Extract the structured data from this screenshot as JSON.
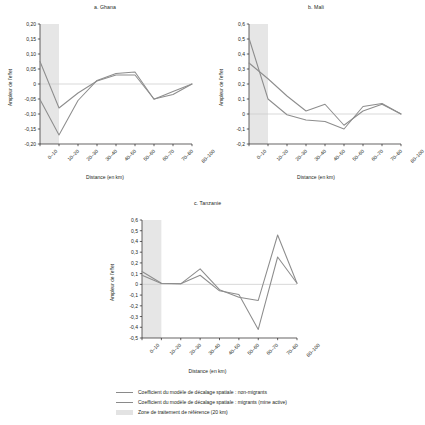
{
  "figure": {
    "background": "#ffffff",
    "line_color_nonmigrants": "#8d8d8d",
    "line_color_migrants": "#8d8d8d",
    "shade_color": "#e6e6e6",
    "zero_line_color": "#c9c9c9",
    "axis_color": "#231f20"
  },
  "legend": {
    "items": [
      {
        "marker": "line",
        "label": "Coefficient du modèle de décalage spatiale : non-migrants"
      },
      {
        "marker": "line",
        "label": "Coefficient du modèle de décalage spatiale : migrants (mine active)"
      },
      {
        "marker": "shade",
        "label": "Zone de traitement de référence (20 km)"
      }
    ]
  },
  "chart_data": [
    {
      "type": "line",
      "title": "a. Ghana",
      "xlabel": "Distance (en km)",
      "ylabel": "Ampleur de l'effet",
      "categories": [
        "0–10",
        "10–20",
        "20–30",
        "30–40",
        "40–50",
        "50–60",
        "60–70",
        "70–80",
        "80–100"
      ],
      "ylim": [
        -0.2,
        0.2
      ],
      "yticks": [
        -0.2,
        -0.15,
        -0.1,
        -0.05,
        0,
        0.05,
        0.1,
        0.15,
        0.2
      ],
      "ytick_labels": [
        "-0,20",
        "-0,15",
        "-0,10",
        "-0,05",
        "0",
        "0,05",
        "0,10",
        "0,15",
        "0,20"
      ],
      "grid": false,
      "zero_line": true,
      "shaded_band": {
        "from_category": "0–10",
        "to_category": "10–20",
        "label": "Zone de traitement de référence (20 km)"
      },
      "legend_position": "below-figure",
      "series": [
        {
          "name": "Coefficient du modèle de décalage spatiale : non-migrants",
          "values": [
            0.075,
            -0.08,
            -0.03,
            0.01,
            0.03,
            0.03,
            -0.05,
            -0.035,
            0.0
          ]
        },
        {
          "name": "Coefficient du modèle de décalage spatiale : migrants (mine active)",
          "values": [
            -0.052,
            -0.17,
            -0.055,
            0.012,
            0.035,
            0.04,
            -0.051,
            -0.025,
            0.0
          ]
        }
      ]
    },
    {
      "type": "line",
      "title": "b. Mali",
      "xlabel": "Distance (en km)",
      "ylabel": "Ampleur de l'effet",
      "categories": [
        "0–10",
        "10–20",
        "20–30",
        "30–40",
        "40–50",
        "50–60",
        "60–70",
        "70–80",
        "80–100"
      ],
      "ylim": [
        -0.2,
        0.6
      ],
      "yticks": [
        -0.2,
        -0.1,
        0,
        0.1,
        0.2,
        0.3,
        0.4,
        0.5,
        0.6
      ],
      "ytick_labels": [
        "-0,2",
        "-0,1",
        "0",
        "0,1",
        "0,2",
        "0,3",
        "0,4",
        "0,5",
        "0,6"
      ],
      "grid": false,
      "zero_line": true,
      "shaded_band": {
        "from_category": "0–10",
        "to_category": "10–20",
        "label": "Zone de traitement de référence (20 km)"
      },
      "legend_position": "below-figure",
      "series": [
        {
          "name": "Coefficient du modèle de décalage spatiale : non-migrants",
          "values": [
            0.505,
            0.1,
            -0.005,
            -0.04,
            -0.05,
            -0.1,
            0.05,
            0.07,
            0.0
          ]
        },
        {
          "name": "Coefficient du modèle de décalage spatiale : migrants (mine active)",
          "values": [
            0.34,
            0.235,
            0.12,
            0.02,
            0.065,
            -0.075,
            0.02,
            0.065,
            0.0
          ]
        }
      ]
    },
    {
      "type": "line",
      "title": "c. Tanzanie",
      "xlabel": "Distance (en km)",
      "ylabel": "Ampleur de l'effet",
      "categories": [
        "0–10",
        "10–20",
        "20–30",
        "30–40",
        "40–50",
        "50–60",
        "60–70",
        "70–80",
        "80–100"
      ],
      "ylim": [
        -0.5,
        0.6
      ],
      "yticks": [
        -0.5,
        -0.4,
        -0.3,
        -0.2,
        -0.1,
        0,
        0.1,
        0.2,
        0.3,
        0.4,
        0.5,
        0.6
      ],
      "ytick_labels": [
        "-0,5",
        "-0,4",
        "-0,3",
        "-0,2",
        "-0,1",
        "0",
        "0,1",
        "0,2",
        "0,3",
        "0,4",
        "0,5",
        "0,6"
      ],
      "grid": false,
      "zero_line": true,
      "shaded_band": {
        "from_category": "0–10",
        "to_category": "10–20",
        "label": "Zone de traitement de référence (20 km)"
      },
      "legend_position": "below-figure",
      "series": [
        {
          "name": "Coefficient du modèle de décalage spatiale : non-migrants",
          "values": [
            0.12,
            0.01,
            0.005,
            0.145,
            -0.05,
            -0.12,
            -0.15,
            0.46,
            0.01
          ]
        },
        {
          "name": "Coefficient du modèle de décalage spatiale : migrants (mine active)",
          "values": [
            0.085,
            0.008,
            0.005,
            0.085,
            -0.06,
            -0.095,
            -0.42,
            0.255,
            0.01
          ]
        }
      ]
    }
  ]
}
